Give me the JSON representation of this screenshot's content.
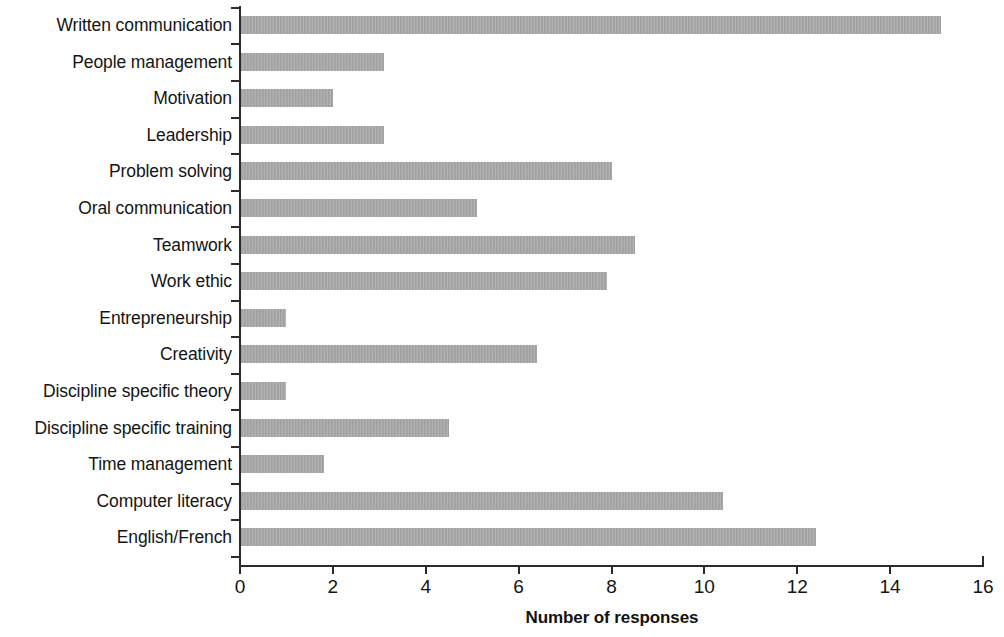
{
  "chart_data": {
    "type": "bar",
    "orientation": "horizontal",
    "title": "",
    "xlabel": "Number of responses",
    "ylabel": "",
    "xlim": [
      0,
      16
    ],
    "xticks": [
      0,
      2,
      4,
      6,
      8,
      10,
      12,
      14,
      16
    ],
    "grid": false,
    "legend": null,
    "bar_color": "#a9a9a9",
    "axis_color": "#2b2b2b",
    "categories": [
      "Written communication",
      "People management",
      "Motivation",
      "Leadership",
      "Problem solving",
      "Oral communication",
      "Teamwork",
      "Work ethic",
      "Entrepreneurship",
      "Creativity",
      "Discipline specific theory",
      "Discipline specific training",
      "Time management",
      "Computer literacy",
      "English/French"
    ],
    "values": [
      15.1,
      3.1,
      2.0,
      3.1,
      8.0,
      5.1,
      8.5,
      7.9,
      1.0,
      6.4,
      1.0,
      4.5,
      1.8,
      10.4,
      12.4
    ]
  }
}
